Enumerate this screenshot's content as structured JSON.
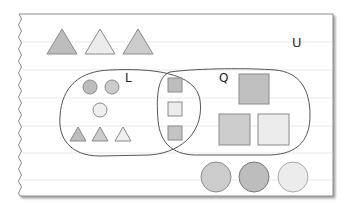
{
  "diagram": {
    "type": "venn-diagram",
    "universe_label": "U",
    "sets": [
      {
        "id": "L",
        "label": "L"
      },
      {
        "id": "Q",
        "label": "Q"
      }
    ],
    "colors": {
      "page": "#ffffff",
      "rule_line": "#e6e6e6",
      "outline": "#555555",
      "shape_stroke": "#8a8a8a",
      "dark_fill": "#bdbdbd",
      "mid_fill": "#cccccc",
      "light_fill": "#ececec"
    },
    "outside_top_triangles": [
      {
        "shade": "dark"
      },
      {
        "shade": "light"
      },
      {
        "shade": "mid"
      }
    ],
    "L_only": {
      "circles": [
        {
          "shade": "dark"
        },
        {
          "shade": "mid"
        },
        {
          "shade": "light"
        }
      ],
      "triangles": [
        {
          "shade": "dark"
        },
        {
          "shade": "mid"
        },
        {
          "shade": "light"
        }
      ]
    },
    "intersection": {
      "small_squares": [
        {
          "shade": "dark"
        },
        {
          "shade": "light"
        },
        {
          "shade": "dark"
        }
      ]
    },
    "Q_only": {
      "large_squares": [
        {
          "shade": "dark"
        },
        {
          "shade": "mid"
        },
        {
          "shade": "light"
        }
      ]
    },
    "outside_bottom_circles": [
      {
        "shade": "mid"
      },
      {
        "shade": "dark"
      },
      {
        "shade": "light"
      }
    ]
  }
}
